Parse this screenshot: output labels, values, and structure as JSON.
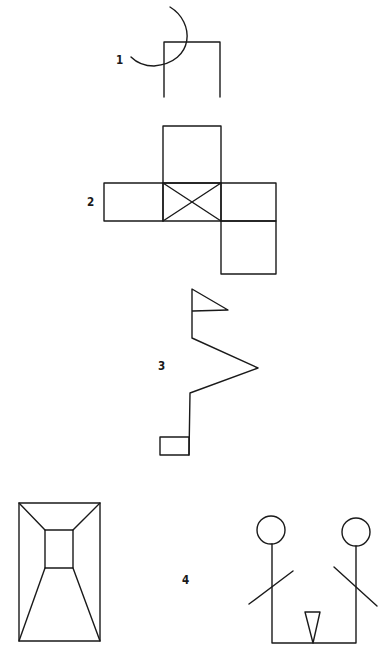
{
  "figures": [
    {
      "label": "1",
      "description": "arc overlapping an open square (three-sided box)"
    },
    {
      "label": "2",
      "description": "cross-shaped net of squares with an X in the center square"
    },
    {
      "label": "3",
      "description": "zig-zag line with a flag on top and a small rectangle at the bottom"
    },
    {
      "label": "4",
      "description": "perspective box/room drawing and two stick figures joined at the base with a triangle"
    }
  ],
  "colors": {
    "stroke": "#1a1a1a",
    "background": "#ffffff"
  }
}
